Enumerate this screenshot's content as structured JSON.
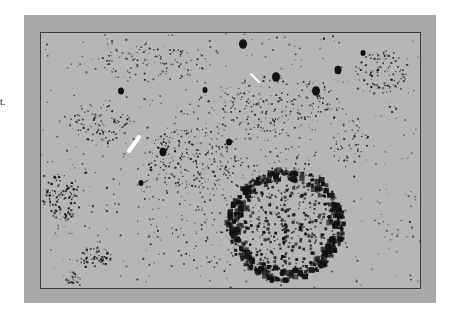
{
  "figure": {
    "side_text": "t.",
    "frame_color": "#a9a9a9",
    "panel_color": "#b6b6b6",
    "border_color": "#3a3a3a",
    "dot_color": "#111111",
    "arrow_color": "#ffffff",
    "arrows": [
      {
        "name": "arrow-left",
        "x1": 98,
        "y1": 104,
        "x2": 88,
        "y2": 118,
        "width": 4
      },
      {
        "name": "arrow-upper-right",
        "x1": 210,
        "y1": 41,
        "x2": 218,
        "y2": 49,
        "width": 2
      }
    ],
    "blobs": [
      {
        "x": 202,
        "y": 11,
        "r": 4
      },
      {
        "x": 235,
        "y": 44,
        "r": 4
      },
      {
        "x": 275,
        "y": 58,
        "r": 4
      },
      {
        "x": 297,
        "y": 37,
        "r": 3.5
      },
      {
        "x": 122,
        "y": 119,
        "r": 3.5
      },
      {
        "x": 188,
        "y": 109,
        "r": 3
      },
      {
        "x": 80,
        "y": 58,
        "r": 3
      },
      {
        "x": 322,
        "y": 20,
        "r": 2.5
      },
      {
        "x": 164,
        "y": 57,
        "r": 2.5
      },
      {
        "x": 100,
        "y": 150,
        "r": 2.5
      }
    ],
    "clusters": [
      {
        "cx": 245,
        "cy": 192,
        "rx": 58,
        "ry": 56,
        "count": 700,
        "size": 2.2,
        "dense_rim": true
      },
      {
        "cx": 20,
        "cy": 165,
        "rx": 18,
        "ry": 25,
        "count": 90,
        "size": 1.6,
        "dense_rim": false
      },
      {
        "cx": 55,
        "cy": 225,
        "rx": 16,
        "ry": 10,
        "count": 60,
        "size": 1.5,
        "dense_rim": false
      },
      {
        "cx": 30,
        "cy": 245,
        "rx": 9,
        "ry": 6,
        "count": 25,
        "size": 1.3,
        "dense_rim": false
      },
      {
        "cx": 340,
        "cy": 40,
        "rx": 26,
        "ry": 22,
        "count": 90,
        "size": 1.4,
        "dense_rim": false
      },
      {
        "cx": 150,
        "cy": 125,
        "rx": 50,
        "ry": 30,
        "count": 180,
        "size": 1.3,
        "dense_rim": false
      },
      {
        "cx": 60,
        "cy": 90,
        "rx": 30,
        "ry": 20,
        "count": 90,
        "size": 1.3,
        "dense_rim": false
      },
      {
        "cx": 110,
        "cy": 30,
        "rx": 60,
        "ry": 20,
        "count": 110,
        "size": 1.2,
        "dense_rim": false
      },
      {
        "cx": 240,
        "cy": 70,
        "rx": 60,
        "ry": 30,
        "count": 160,
        "size": 1.2,
        "dense_rim": false
      },
      {
        "cx": 190,
        "cy": 150,
        "rx": 90,
        "ry": 90,
        "count": 300,
        "size": 1.2,
        "dense_rim": false
      },
      {
        "cx": 310,
        "cy": 110,
        "rx": 20,
        "ry": 25,
        "count": 45,
        "size": 1.3,
        "dense_rim": false
      }
    ]
  }
}
